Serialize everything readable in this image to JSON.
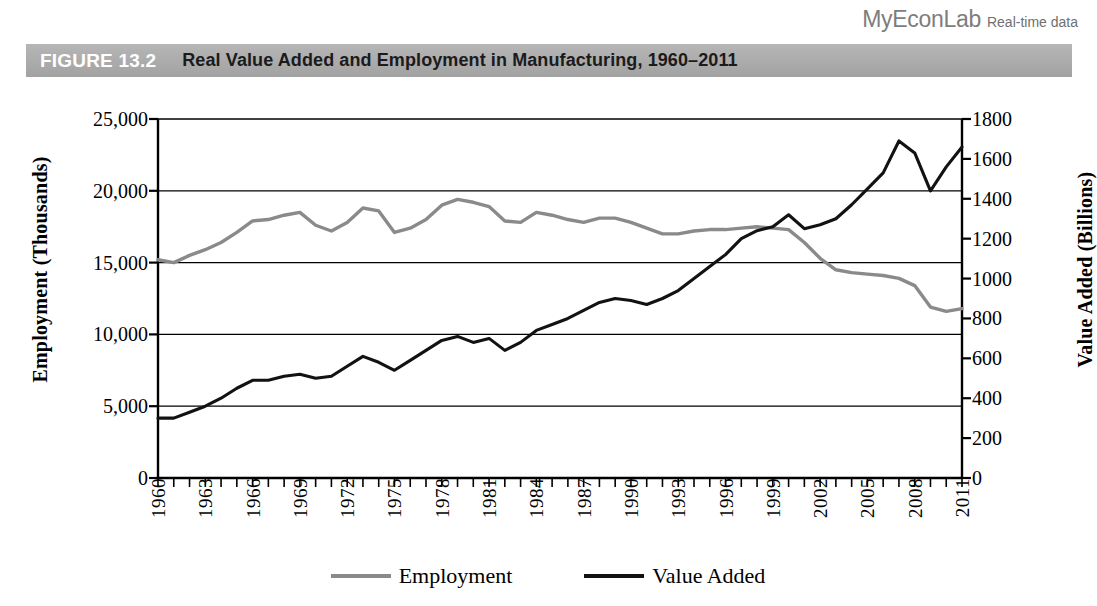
{
  "brand": {
    "name": "MyEconLab",
    "tagline": "Real-time data"
  },
  "figure": {
    "label": "FIGURE 13.2",
    "title": "Real Value Added and Employment in Manufacturing, 1960–2011"
  },
  "colors": {
    "employment_line": "#8a8a8a",
    "value_added_line": "#121212",
    "title_bar": "#ababab",
    "axis": "#000000",
    "grid": "#000000"
  },
  "chart_data": {
    "type": "line",
    "title": "Real Value Added and Employment in Manufacturing, 1960–2011",
    "xlabel": "",
    "ylabel": "Employment (Thousands)",
    "y2label": "Value Added (Billions)",
    "ylim": [
      0,
      25000
    ],
    "y2lim": [
      0,
      1800
    ],
    "yticks": [
      "0",
      "5,000",
      "10,000",
      "15,000",
      "20,000",
      "25,000"
    ],
    "ytick_values": [
      0,
      5000,
      10000,
      15000,
      20000,
      25000
    ],
    "y2ticks": [
      "0",
      "200",
      "400",
      "600",
      "800",
      "1000",
      "1200",
      "1400",
      "1600",
      "1800"
    ],
    "y2tick_values": [
      0,
      200,
      400,
      600,
      800,
      1000,
      1200,
      1400,
      1600,
      1800
    ],
    "grid": "horizontal",
    "legend_position": "bottom",
    "xlim": [
      1960,
      2011
    ],
    "x": [
      1960,
      1961,
      1962,
      1963,
      1964,
      1965,
      1966,
      1967,
      1968,
      1969,
      1970,
      1971,
      1972,
      1973,
      1974,
      1975,
      1976,
      1977,
      1978,
      1979,
      1980,
      1981,
      1982,
      1983,
      1984,
      1985,
      1986,
      1987,
      1988,
      1989,
      1990,
      1991,
      1992,
      1993,
      1994,
      1995,
      1996,
      1997,
      1998,
      1999,
      2000,
      2001,
      2002,
      2003,
      2004,
      2005,
      2006,
      2007,
      2008,
      2009,
      2010,
      2011
    ],
    "xticks": [
      "1960",
      "1963",
      "1966",
      "1969",
      "1972",
      "1975",
      "1978",
      "1981",
      "1984",
      "1987",
      "1990",
      "1993",
      "1996",
      "1999",
      "2002",
      "2005",
      "2008",
      "2011"
    ],
    "xtick_values": [
      1960,
      1963,
      1966,
      1969,
      1972,
      1975,
      1978,
      1981,
      1984,
      1987,
      1990,
      1993,
      1996,
      1999,
      2002,
      2005,
      2008,
      2011
    ],
    "series": [
      {
        "name": "Employment",
        "axis": "left",
        "color": "#8a8a8a",
        "unit": "Thousands",
        "values": [
          15200,
          15000,
          15500,
          15900,
          16400,
          17100,
          17900,
          18000,
          18300,
          18500,
          17600,
          17200,
          17800,
          18800,
          18600,
          17100,
          17400,
          18000,
          19000,
          19400,
          19200,
          18900,
          17900,
          17800,
          18500,
          18300,
          18000,
          17800,
          18100,
          18100,
          17800,
          17400,
          17000,
          17000,
          17200,
          17300,
          17300,
          17400,
          17500,
          17400,
          17300,
          16400,
          15300,
          14500,
          14300,
          14200,
          14100,
          13900,
          13400,
          11900,
          11600,
          11800
        ]
      },
      {
        "name": "Value Added",
        "axis": "right",
        "color": "#121212",
        "unit": "Billions",
        "values": [
          300,
          300,
          330,
          360,
          400,
          450,
          490,
          490,
          510,
          520,
          500,
          510,
          560,
          610,
          580,
          540,
          590,
          640,
          690,
          710,
          680,
          700,
          640,
          680,
          740,
          770,
          800,
          840,
          880,
          900,
          890,
          870,
          900,
          940,
          1000,
          1060,
          1120,
          1200,
          1240,
          1260,
          1320,
          1250,
          1270,
          1300,
          1370,
          1450,
          1530,
          1690,
          1630,
          1440,
          1560,
          1660
        ]
      }
    ]
  },
  "legend": {
    "items": [
      {
        "label": "Employment",
        "color": "#8a8a8a"
      },
      {
        "label": "Value Added",
        "color": "#121212"
      }
    ]
  }
}
